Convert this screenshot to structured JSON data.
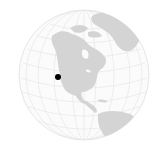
{
  "map": {
    "type": "locator-globe",
    "projection": "orthographic",
    "region_shown": "North America",
    "marker": {
      "label": "Location marker",
      "color": "#000000"
    },
    "colors": {
      "ocean": "#fbfbfb",
      "land": "#d4d4d4",
      "graticule": "#e6e6e6",
      "rim": "#e0e0e0",
      "background": "#ffffff"
    }
  }
}
